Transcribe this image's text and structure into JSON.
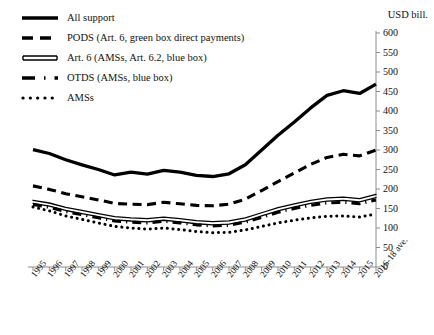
{
  "chart_data": {
    "type": "line",
    "title": "",
    "subtitle": "",
    "xlabel": "",
    "ylabel": "USD bill.",
    "unit_label": "USD bill.",
    "ylim": [
      0,
      600
    ],
    "ytick_step": 50,
    "yticks": [
      0,
      50,
      100,
      150,
      200,
      250,
      300,
      350,
      400,
      450,
      500,
      550,
      600
    ],
    "grid": false,
    "legend_position": "top-left",
    "categories": [
      "1995",
      "1996",
      "1997",
      "1998",
      "1999",
      "2000",
      "2001",
      "2002",
      "2003",
      "2004",
      "2005",
      "2006",
      "2007",
      "2008",
      "2009",
      "2010",
      "2011",
      "2012",
      "2013",
      "2014",
      "2015",
      "2016-18 ave."
    ],
    "series": [
      {
        "name": "All support",
        "style": "solid-thick",
        "values": [
          301,
          291,
          275,
          262,
          250,
          236,
          243,
          238,
          248,
          243,
          235,
          232,
          239,
          262,
          300,
          338,
          372,
          408,
          440,
          452,
          445,
          469
        ]
      },
      {
        "name": "PODS (Art. 6, green box direct payments)",
        "style": "dashed",
        "values": [
          208,
          199,
          188,
          180,
          172,
          163,
          161,
          160,
          166,
          162,
          158,
          157,
          161,
          174,
          196,
          219,
          241,
          263,
          281,
          289,
          285,
          300
        ]
      },
      {
        "name": "Art. 6 (AMSs, Art. 6.2, blue box)",
        "style": "double-line",
        "values": [
          167,
          160,
          149,
          141,
          133,
          125,
          122,
          120,
          124,
          120,
          115,
          112,
          114,
          122,
          135,
          148,
          158,
          167,
          173,
          175,
          171,
          182
        ]
      },
      {
        "name": "OTDS (AMSs, blue box)",
        "style": "dash-dot",
        "values": [
          160,
          153,
          142,
          134,
          126,
          118,
          115,
          113,
          117,
          113,
          108,
          105,
          107,
          115,
          127,
          140,
          150,
          158,
          164,
          166,
          162,
          172
        ]
      },
      {
        "name": "AMSs",
        "style": "dotted",
        "values": [
          154,
          144,
          131,
          122,
          113,
          104,
          100,
          97,
          100,
          96,
          91,
          88,
          89,
          95,
          104,
          113,
          120,
          126,
          130,
          131,
          128,
          136
        ]
      }
    ],
    "legend": [
      {
        "label": "All support",
        "swatch": "solid-thick"
      },
      {
        "label": "PODS (Art. 6, green box direct payments)",
        "swatch": "dashed"
      },
      {
        "label": "Art. 6 (AMSs, Art. 6.2, blue box)",
        "swatch": "double-line"
      },
      {
        "label": "OTDS (AMSs, blue box)",
        "swatch": "dash-dot"
      },
      {
        "label": "AMSs",
        "swatch": "dotted"
      }
    ],
    "colors": {
      "line": "#000000",
      "axis": "#8c8c8c",
      "text": "#111111",
      "background": "#ffffff"
    }
  }
}
